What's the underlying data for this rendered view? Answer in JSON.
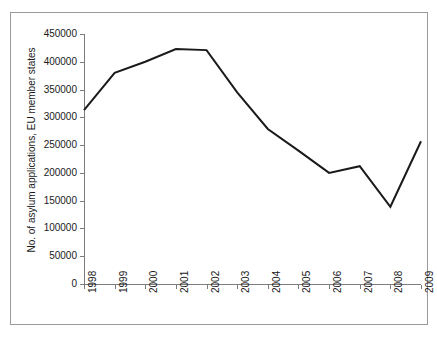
{
  "chart_data": {
    "type": "line",
    "title": "",
    "xlabel": "",
    "ylabel": "No. of asylum applications, EU member states",
    "categories": [
      "1998",
      "1999",
      "2000",
      "2001",
      "2002",
      "2003",
      "2004",
      "2005",
      "2006",
      "2007",
      "2008",
      "2009"
    ],
    "values": [
      313000,
      380000,
      400000,
      423000,
      421000,
      345000,
      279000,
      240000,
      200000,
      212000,
      139000,
      257000
    ],
    "series": [
      {
        "name": "No. of asylum applications, EU member states",
        "values": [
          313000,
          380000,
          400000,
          423000,
          421000,
          345000,
          279000,
          240000,
          200000,
          212000,
          139000,
          257000
        ]
      }
    ],
    "ylim": [
      0,
      450000
    ],
    "ytick_step": 50000,
    "yticks": [
      0,
      50000,
      100000,
      150000,
      200000,
      250000,
      300000,
      350000,
      400000,
      450000
    ],
    "ytick_labels": [
      "0",
      "50000",
      "100000",
      "150000",
      "200000",
      "250000",
      "300000",
      "350000",
      "400000",
      "450000"
    ],
    "grid": false,
    "legend": "none",
    "line_color": "#1a1a1a",
    "line_width": 2,
    "markers": "none",
    "border_color": "#9a9a9a",
    "axis_color": "#7d7d7d",
    "background": "#ffffff"
  }
}
